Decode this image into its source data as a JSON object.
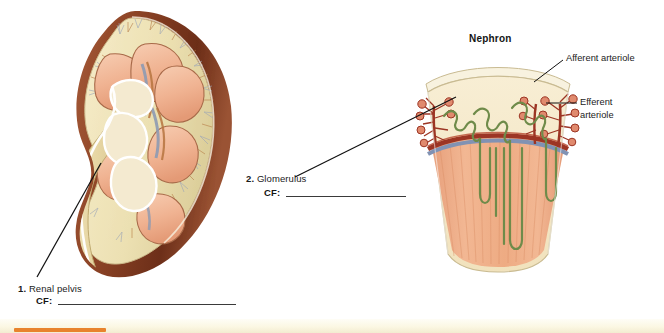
{
  "page": {
    "background_color": "#ffffff"
  },
  "kidney_figure": {
    "name": "kidney-coronal-section",
    "colors": {
      "capsule": "#8d4426",
      "cortex": "#f0e2b8",
      "pyramid": "#f0b392",
      "pelvis": "#e6d5a2",
      "vessel_red": "#a13a25",
      "vessel_blue": "#8e9cb4"
    }
  },
  "nephron_figure": {
    "heading": "Nephron",
    "name": "nephron-wedge-section",
    "colors": {
      "cortex": "#f5e8c6",
      "medulla": "#efab85",
      "tubule_green": "#6f8b4a",
      "artery_red": "#9c3524",
      "vein_blue": "#7e8fb0",
      "corpuscle": "#d96b52"
    },
    "annotations": [
      {
        "id": "afferent",
        "label": "Afferent arteriole"
      },
      {
        "id": "efferent",
        "label_line1": "Efferent",
        "label_line2": "arteriole"
      }
    ]
  },
  "callouts": [
    {
      "number": "1.",
      "term": "Renal pelvis",
      "cf_label": "CF:",
      "cf_value": "",
      "rule_width_px": 178
    },
    {
      "number": "2.",
      "term": "Glomerulus",
      "cf_label": "CF:",
      "cf_value": "",
      "rule_width_px": 120
    }
  ],
  "footer": {
    "accent_color": "#e8832c",
    "band_color": "#faf6e2"
  }
}
